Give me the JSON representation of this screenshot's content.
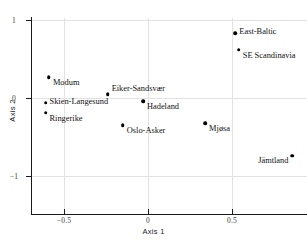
{
  "chart_data": {
    "type": "scatter",
    "title": "",
    "xlabel": "Axis 1",
    "ylabel": "Axis 2",
    "xlim": [
      -0.72,
      0.92
    ],
    "ylim": [
      -1.25,
      1.0
    ],
    "xticks": [
      -0.5,
      0,
      0.5
    ],
    "xticklabels": [
      "−0.5",
      "0",
      "0.5"
    ],
    "yticks": [
      1,
      0,
      -1
    ],
    "yticklabels": [
      "1",
      "0",
      "−1"
    ],
    "grid": true,
    "legend": "none",
    "marker_color": "#000000",
    "points": [
      {
        "label": "East-Baltic",
        "x": 0.52,
        "y": 0.83,
        "label_pos": "right"
      },
      {
        "label": "SE Scandinavia",
        "x": 0.54,
        "y": 0.62,
        "label_pos": "below-right"
      },
      {
        "label": "Modum",
        "x": -0.59,
        "y": 0.27,
        "label_pos": "below-right"
      },
      {
        "label": "Eiker-Sandsvær",
        "x": -0.24,
        "y": 0.05,
        "label_pos": "above-right"
      },
      {
        "label": "Skien-Langesund",
        "x": -0.61,
        "y": -0.06,
        "label_pos": "right"
      },
      {
        "label": "Hadeland",
        "x": -0.03,
        "y": -0.04,
        "label_pos": "below-right"
      },
      {
        "label": "Ringerike",
        "x": -0.61,
        "y": -0.19,
        "label_pos": "below-right"
      },
      {
        "label": "Oslo-Asker",
        "x": -0.15,
        "y": -0.35,
        "label_pos": "below-right"
      },
      {
        "label": "Mjøsa",
        "x": 0.34,
        "y": -0.32,
        "label_pos": "below-right"
      },
      {
        "label": "Jämtland",
        "x": 0.86,
        "y": -0.74,
        "label_pos": "left"
      }
    ]
  }
}
